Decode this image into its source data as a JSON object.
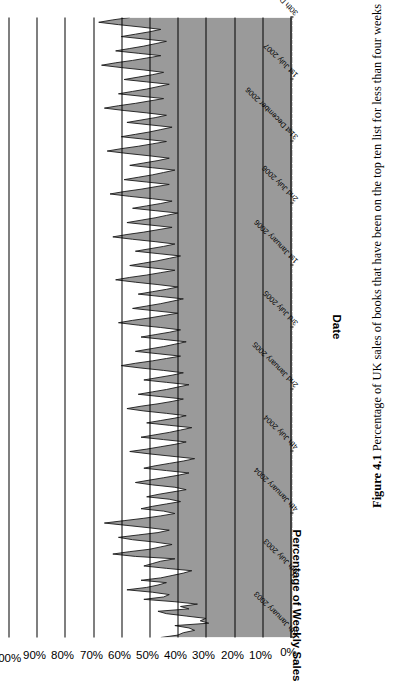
{
  "figure": {
    "number_label": "Figure 4.1",
    "caption": "Percentage of UK sales of books that have been on the top ten list for less than four weeks"
  },
  "chart_data": {
    "type": "area",
    "title": "",
    "xlabel": "Date",
    "ylabel": "Percentage of Weekly Sales",
    "ylim": [
      0,
      100
    ],
    "yticks": [
      "0%",
      "10%",
      "20%",
      "30%",
      "40%",
      "50%",
      "60%",
      "70%",
      "80%",
      "90%",
      "100%"
    ],
    "ytick_values": [
      0,
      10,
      20,
      30,
      40,
      50,
      60,
      70,
      80,
      90,
      100
    ],
    "grid": true,
    "grid_axis": "y",
    "legend": "none",
    "fill_color": "#9a9a9a",
    "line_color": "#1a1a1a",
    "xtick_labels": [
      "5th January 2003",
      "6th July 2003",
      "4th January 2004",
      "4th July 2004",
      "2nd January 2005",
      "3rd July 2005",
      "1st January 2006",
      "2nd July 2006",
      "31st December 2006",
      "1st July 2007",
      "30th December 2007"
    ],
    "xtick_positions": [
      0,
      26,
      52,
      78,
      104,
      130,
      156,
      182,
      208,
      234,
      260
    ],
    "x_count": 261,
    "x_note": "weekly observations, 5 January 2003 to 30 December 2007",
    "values": [
      46,
      40,
      38,
      34,
      36,
      41,
      29,
      32,
      30,
      37,
      44,
      47,
      36,
      39,
      33,
      41,
      52,
      45,
      43,
      49,
      58,
      51,
      47,
      44,
      53,
      46,
      42,
      38,
      35,
      44,
      52,
      49,
      46,
      41,
      55,
      63,
      57,
      50,
      46,
      42,
      48,
      56,
      61,
      54,
      47,
      43,
      50,
      58,
      66,
      59,
      52,
      46,
      41,
      45,
      53,
      49,
      44,
      39,
      43,
      51,
      47,
      42,
      37,
      41,
      49,
      55,
      50,
      45,
      40,
      36,
      44,
      52,
      48,
      43,
      38,
      34,
      42,
      50,
      57,
      51,
      46,
      41,
      37,
      45,
      53,
      48,
      43,
      39,
      35,
      43,
      51,
      46,
      41,
      37,
      44,
      52,
      58,
      53,
      47,
      42,
      38,
      46,
      54,
      49,
      44,
      40,
      36,
      44,
      52,
      47,
      42,
      38,
      45,
      53,
      60,
      55,
      49,
      44,
      39,
      47,
      55,
      50,
      45,
      41,
      37,
      45,
      53,
      48,
      43,
      39,
      46,
      54,
      61,
      56,
      50,
      45,
      40,
      48,
      56,
      51,
      46,
      42,
      38,
      46,
      54,
      49,
      44,
      40,
      47,
      55,
      62,
      57,
      51,
      46,
      41,
      49,
      57,
      52,
      47,
      43,
      39,
      47,
      55,
      50,
      45,
      41,
      48,
      56,
      63,
      58,
      52,
      47,
      42,
      50,
      58,
      53,
      48,
      44,
      40,
      48,
      56,
      51,
      46,
      42,
      49,
      57,
      64,
      59,
      53,
      48,
      43,
      51,
      59,
      54,
      49,
      45,
      41,
      49,
      57,
      52,
      47,
      43,
      50,
      58,
      65,
      60,
      54,
      49,
      44,
      52,
      60,
      55,
      50,
      46,
      42,
      50,
      58,
      53,
      48,
      44,
      51,
      59,
      66,
      61,
      55,
      50,
      45,
      53,
      61,
      56,
      51,
      47,
      43,
      51,
      59,
      54,
      49,
      45,
      52,
      60,
      67,
      62,
      56,
      51,
      46,
      54,
      62,
      57,
      52,
      48,
      44,
      52,
      60,
      55,
      50,
      46,
      53,
      61,
      68,
      63,
      57
    ]
  }
}
